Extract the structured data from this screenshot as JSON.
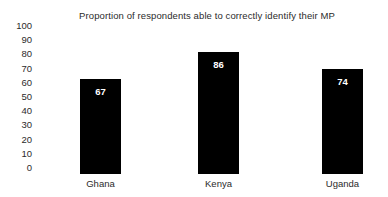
{
  "chart_data": {
    "type": "bar",
    "title": "Proportion of respondents able to correctly identify their MP",
    "xlabel": "",
    "ylabel": "",
    "categories": [
      "Ghana",
      "Kenya",
      "Uganda"
    ],
    "values": [
      67,
      86,
      74
    ],
    "ylim": [
      0,
      100
    ],
    "yticks": [
      100,
      90,
      80,
      70,
      60,
      50,
      40,
      30,
      20,
      10,
      0
    ],
    "grid": false,
    "legend": false,
    "bar_color": "#000000",
    "value_label_color": "#ffffff",
    "background_color": "#ffffff",
    "text_color": "#2b2b2b"
  }
}
